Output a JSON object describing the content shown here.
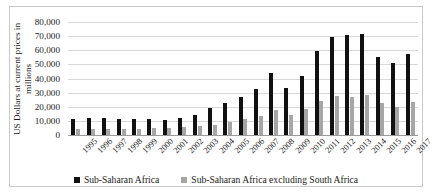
{
  "chart_data": {
    "type": "bar",
    "title": "",
    "xlabel": "",
    "ylabel": "US Dollars at current prices in millions",
    "ylabel_line1": "US Dollars at current prices in",
    "ylabel_line2": "millions",
    "ylim": [
      0,
      80000
    ],
    "ytick_step": 10000,
    "ytick_labels": [
      "80,000",
      "70,000",
      "60,000",
      "50,000",
      "40,000",
      "30,000",
      "20,000",
      "10,000",
      "0"
    ],
    "ytick_values": [
      80000,
      70000,
      60000,
      50000,
      40000,
      30000,
      20000,
      10000,
      0
    ],
    "grid": true,
    "legend_position": "bottom",
    "categories": [
      "1995",
      "1996",
      "1997",
      "1998",
      "1999",
      "2000",
      "2001",
      "2002",
      "2003",
      "2004",
      "2005",
      "2006",
      "2007",
      "2008",
      "2009",
      "2010",
      "2011",
      "2012",
      "2013",
      "2014",
      "2015",
      "2016",
      "2017"
    ],
    "series": [
      {
        "name": "Sub-Saharan Africa",
        "color": "#111111",
        "values": [
          11200,
          12000,
          12100,
          11000,
          11000,
          11200,
          10800,
          12400,
          14400,
          18900,
          22400,
          26600,
          32400,
          44200,
          33200,
          41600,
          59200,
          69200,
          71000,
          71500,
          55000,
          50800,
          57200
        ]
      },
      {
        "name": "Sub-Saharan Africa excluding South Africa",
        "color": "#a6a6a6",
        "values": [
          4200,
          4400,
          4500,
          4400,
          4400,
          5000,
          5000,
          5400,
          6200,
          7400,
          9400,
          11000,
          13200,
          17600,
          14400,
          18400,
          23800,
          27800,
          26600,
          28000,
          22400,
          19800,
          23400
        ]
      }
    ]
  },
  "legend": {
    "items": [
      {
        "label": "Sub-Saharan Africa",
        "color": "#111111"
      },
      {
        "label": "Sub-Saharan Africa excluding South Africa",
        "color": "#a6a6a6"
      }
    ]
  }
}
